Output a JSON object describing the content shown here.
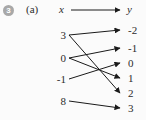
{
  "badge": {
    "number": "3"
  },
  "part_label": "(a)",
  "diagram": {
    "type": "mapping-diagram",
    "domain_label": "x",
    "codomain_label": "y",
    "left_values": [
      "3",
      "0",
      "-1",
      "8"
    ],
    "right_values": [
      "-2",
      "-1",
      "0",
      "1",
      "2",
      "3"
    ],
    "mappings": [
      {
        "from": "3",
        "to": "-2"
      },
      {
        "from": "3",
        "to": "2"
      },
      {
        "from": "0",
        "to": "-1"
      },
      {
        "from": "0",
        "to": "1"
      },
      {
        "from": "-1",
        "to": "0"
      },
      {
        "from": "8",
        "to": "3"
      }
    ]
  },
  "colors": {
    "arrow": "#1a1a1a",
    "text": "#2b2b2b",
    "badge_bg": "#a8a8a8",
    "badge_text": "#ffffff",
    "background": "#fbfbfb"
  }
}
